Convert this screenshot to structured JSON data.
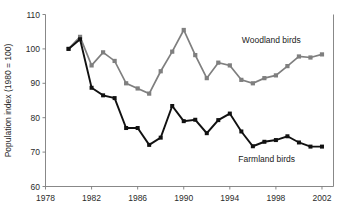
{
  "chart_data": {
    "type": "line",
    "title": "",
    "xlabel": "",
    "ylabel": "Population index (1980 = 100)",
    "xlim": [
      1978,
      2003
    ],
    "ylim": [
      60,
      110
    ],
    "ytick_labels": [
      "60",
      "70",
      "80",
      "90",
      "100",
      "110"
    ],
    "yticks": [
      60,
      70,
      80,
      90,
      100,
      110
    ],
    "xtick_labels": [
      "1978",
      "1982",
      "1986",
      "1990",
      "1994",
      "1998",
      "2002"
    ],
    "xticks": [
      1978,
      1982,
      1986,
      1990,
      1994,
      1998,
      2002
    ],
    "grid": false,
    "legend_position": "inline-annotation",
    "x": [
      1980,
      1981,
      1982,
      1983,
      1984,
      1985,
      1986,
      1987,
      1988,
      1989,
      1990,
      1991,
      1992,
      1993,
      1994,
      1995,
      1996,
      1997,
      1998,
      1999,
      2000,
      2001,
      2002
    ],
    "series": [
      {
        "name": "Woodland birds",
        "color": "#7f7f7f",
        "marker": "square",
        "values": [
          100.0,
          103.5,
          95.2,
          99.0,
          96.5,
          90.0,
          88.5,
          87.0,
          93.5,
          99.2,
          105.5,
          98.2,
          91.5,
          96.0,
          95.2,
          91.0,
          90.0,
          91.5,
          92.3,
          95.0,
          97.8,
          97.5,
          98.4
        ]
      },
      {
        "name": "Farmland birds",
        "color": "#111111",
        "marker": "square",
        "values": [
          100.0,
          102.8,
          88.7,
          86.5,
          85.7,
          77.0,
          77.0,
          72.1,
          74.2,
          83.4,
          79.0,
          79.4,
          75.5,
          79.3,
          81.2,
          76.0,
          71.7,
          73.0,
          73.5,
          74.6,
          72.8,
          71.6,
          71.6
        ]
      }
    ],
    "annotations": [
      {
        "text": "Woodland birds",
        "x": 1997.6,
        "y": 101.6
      },
      {
        "text": "Farmland birds",
        "x": 1997.2,
        "y": 67.2
      }
    ]
  }
}
